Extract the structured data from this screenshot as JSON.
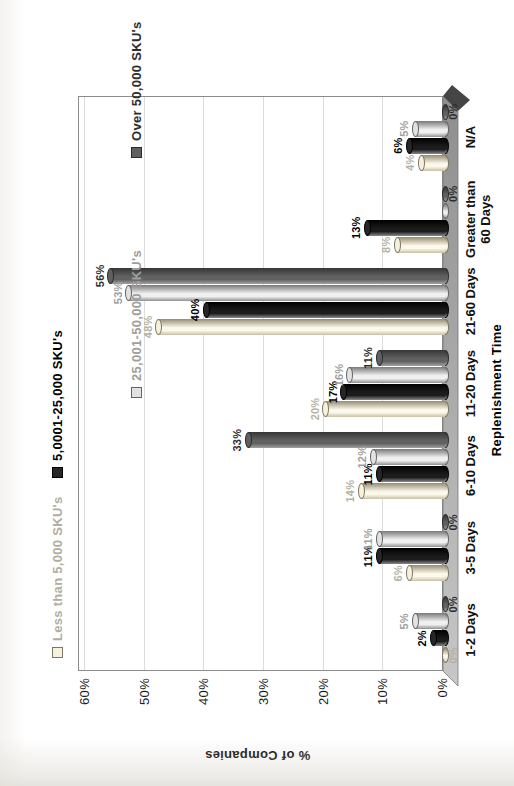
{
  "chart_data": {
    "type": "bar",
    "style": "3d-cylinder-clustered",
    "rotated_on_page_degrees": -90,
    "title": "",
    "xlabel": "Replenishment Time",
    "ylabel": "% of Companies",
    "ylim": [
      0,
      60
    ],
    "ytick_step": 10,
    "ytick_labels": [
      "0%",
      "10%",
      "20%",
      "30%",
      "40%",
      "50%",
      "60%"
    ],
    "grid": true,
    "legend_position": "top-two-rows",
    "legend_rows": [
      [
        "Less than 5,000 SKU's",
        "5,0001-25,000 SKU's"
      ],
      [
        "25,001-50,000 SKU's",
        "Over 50,000 SKU's"
      ]
    ],
    "categories": [
      "1-2 Days",
      "3-5 Days",
      "6-10 Days",
      "11-20 Days",
      "21-60 Days",
      "Greater than 60 Days",
      "N/A"
    ],
    "series": [
      {
        "name": "Less than 5,000 SKU's",
        "values": [
          0,
          6,
          14,
          20,
          48,
          8,
          4
        ],
        "value_labels": [
          "0%",
          "6%",
          "14%",
          "20%",
          "48%",
          "8%",
          "4%"
        ],
        "color_light": "#c6c0a8",
        "color_mid": "#fcf8ea",
        "color_dark": "#948c71",
        "cap_color": "#f6f1dd",
        "edge_color": "#7d7663",
        "label_color": "#b6b2a3"
      },
      {
        "name": "5,0001-25,000 SKU's",
        "values": [
          2,
          11,
          11,
          17,
          40,
          13,
          6
        ],
        "value_labels": [
          "2%",
          "11%",
          "11%",
          "17%",
          "40%",
          "13%",
          "6%"
        ],
        "color_light": "#8a8a8a",
        "color_mid": "#1c1c1c",
        "color_dark": "#000000",
        "cap_color": "#262626",
        "edge_color": "#000000",
        "label_color": "#000000"
      },
      {
        "name": "25,001-50,000 SKU's",
        "values": [
          5,
          11,
          12,
          16,
          53,
          0,
          5
        ],
        "value_labels": [
          "5%",
          "11%",
          "12%",
          "16%",
          "53%",
          "0%",
          "5%"
        ],
        "color_light": "#909090",
        "color_mid": "#f0f0f0",
        "color_dark": "#797979",
        "cap_color": "#e2e2e2",
        "edge_color": "#646464",
        "label_color": "#9e9e9e"
      },
      {
        "name": "Over 50,000 SKU's",
        "values": [
          0,
          0,
          33,
          11,
          56,
          0,
          0
        ],
        "value_labels": [
          "0%",
          "0%",
          "33%",
          "11%",
          "56%",
          "0%",
          "0%"
        ],
        "color_light": "#a2a2a2",
        "color_mid": "#616161",
        "color_dark": "#363636",
        "cap_color": "#606060",
        "edge_color": "#2b2b2b",
        "label_color": "#2d2d2d"
      }
    ],
    "colors": {
      "floor_light": "#c7c7c7",
      "floor_dark": "#8e8e8e",
      "floor_edge": "#7a7a7a",
      "floor_end_cap": "#454545",
      "wall_border": "#8c8c8c",
      "gridline": "#dcdcdc",
      "background": "#ffffff"
    }
  }
}
